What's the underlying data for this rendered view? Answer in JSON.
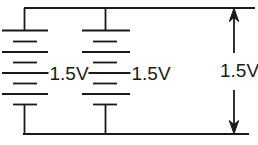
{
  "diagram": {
    "battery_left": {
      "label": "1.5V"
    },
    "battery_right": {
      "label": "1.5V"
    },
    "voltage_arrow": {
      "label": "1.5V"
    }
  },
  "colors": {
    "line": "#1a1a1a",
    "background": "#ffffff"
  }
}
